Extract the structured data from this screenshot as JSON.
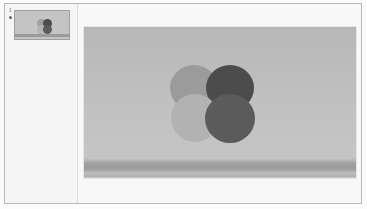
{
  "thumbnail_pane": {
    "slides": [
      {
        "number": "1",
        "selected": true
      }
    ]
  },
  "slide": {
    "background_top": "#b7b7b7",
    "background_bottom": "#c6c6c6",
    "band_color": "#9a9a9a",
    "circles": [
      {
        "position": "top-left",
        "color": "#9b9b9b"
      },
      {
        "position": "top-right",
        "color": "#4c4c4c"
      },
      {
        "position": "bottom-left",
        "color": "#b2b2b2"
      },
      {
        "position": "bottom-right",
        "color": "#5b5b5b"
      }
    ]
  }
}
